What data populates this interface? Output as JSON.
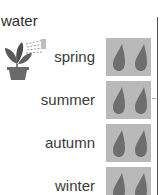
{
  "title": "water",
  "icons": {
    "plant": "watering-plant-icon",
    "drop": "water-drop-icon"
  },
  "colors": {
    "box": "#b9b9b9",
    "drop": "#6e6e6e",
    "line": "#555555"
  },
  "rows": [
    {
      "label": "spring",
      "drops": 2
    },
    {
      "label": "summer",
      "drops": 2
    },
    {
      "label": "autumn",
      "drops": 2
    },
    {
      "label": "winter",
      "drops": 2
    }
  ]
}
